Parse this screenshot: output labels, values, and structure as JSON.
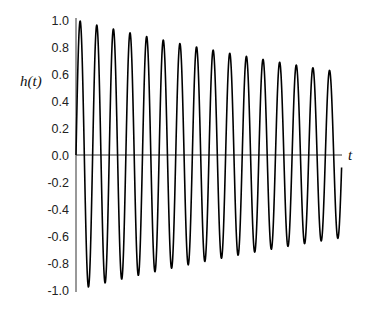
{
  "chart_data": {
    "type": "line",
    "title": "",
    "xlabel": "t",
    "ylabel": "h(t)",
    "ylim": [
      -1.0,
      1.0
    ],
    "xlim": [
      0,
      1
    ],
    "grid": false,
    "legend": null,
    "yticks": [
      1.0,
      0.8,
      0.6,
      0.4,
      0.2,
      0.0,
      -0.2,
      -0.4,
      -0.6,
      -0.8,
      -1.0
    ],
    "ytick_labels": [
      "1.0",
      "0.8",
      "0.6",
      "0.4",
      "0.2",
      "0.0",
      "-0.2",
      "-0.4",
      "-0.6",
      "-0.8",
      "-1.0"
    ],
    "xticks": [],
    "series": [
      {
        "name": "h(t)",
        "function": {
          "form": "exp(-a*t)*sin(2*pi*f*t)",
          "a": 0.49,
          "f": 16,
          "t_start": 0,
          "t_end": 0.9985,
          "samples": 1200
        },
        "peaks": [
          {
            "t": 0.016,
            "h": 0.99
          },
          {
            "t": 0.078,
            "h": 0.96
          },
          {
            "t": 0.141,
            "h": 0.93
          },
          {
            "t": 0.203,
            "h": 0.9
          },
          {
            "t": 0.266,
            "h": 0.88
          },
          {
            "t": 0.328,
            "h": 0.85
          },
          {
            "t": 0.391,
            "h": 0.83
          },
          {
            "t": 0.453,
            "h": 0.8
          },
          {
            "t": 0.516,
            "h": 0.78
          },
          {
            "t": 0.578,
            "h": 0.75
          },
          {
            "t": 0.641,
            "h": 0.73
          },
          {
            "t": 0.703,
            "h": 0.71
          },
          {
            "t": 0.766,
            "h": 0.69
          },
          {
            "t": 0.828,
            "h": 0.67
          },
          {
            "t": 0.891,
            "h": 0.65
          },
          {
            "t": 0.953,
            "h": 0.63
          }
        ],
        "troughs": [
          {
            "t": 0.047,
            "h": -0.98
          },
          {
            "t": 0.109,
            "h": -0.95
          },
          {
            "t": 0.172,
            "h": -0.92
          },
          {
            "t": 0.234,
            "h": -0.89
          },
          {
            "t": 0.297,
            "h": -0.86
          },
          {
            "t": 0.359,
            "h": -0.84
          },
          {
            "t": 0.422,
            "h": -0.81
          },
          {
            "t": 0.484,
            "h": -0.79
          },
          {
            "t": 0.547,
            "h": -0.76
          },
          {
            "t": 0.609,
            "h": -0.74
          },
          {
            "t": 0.672,
            "h": -0.72
          },
          {
            "t": 0.734,
            "h": -0.7
          },
          {
            "t": 0.797,
            "h": -0.68
          },
          {
            "t": 0.859,
            "h": -0.66
          },
          {
            "t": 0.922,
            "h": -0.64
          },
          {
            "t": 0.984,
            "h": -0.62
          }
        ],
        "end_value": -0.06,
        "color": "#000000"
      }
    ]
  },
  "layout": {
    "plot_left_px": 76,
    "plot_right_px": 342,
    "curve_end_px": 341,
    "y_top_px": 20,
    "y_zero_px": 155,
    "y_bottom_px": 290,
    "axis_color": "#333333",
    "curve_color": "#000000"
  }
}
